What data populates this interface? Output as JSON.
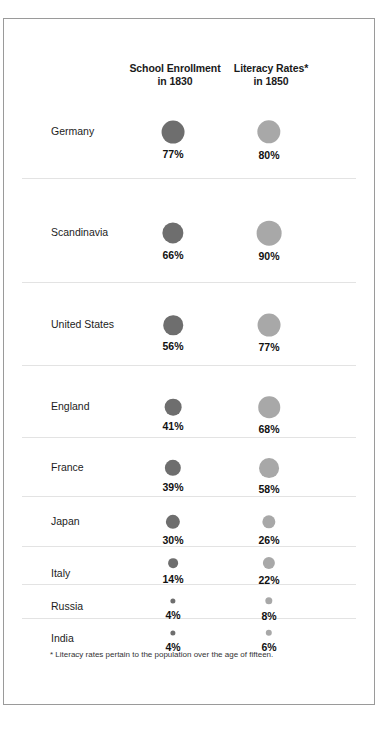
{
  "header": {
    "col1_line1": "School Enrollment",
    "col1_line2": "in 1830",
    "col2_line1": "Literacy Rates*",
    "col2_line2": "in 1850"
  },
  "footnote": "* Literacy rates pertain to the population over the age of fifteen.",
  "colors": {
    "enrollment_bubble": "#6e6e6e",
    "literacy_bubble": "#a8a8a8",
    "divider": "#e3e3e3",
    "frame": "#9a9a9a",
    "text": "#1a1a1a",
    "background": "#ffffff"
  },
  "rows": [
    {
      "label": "Germany",
      "enrollment": "77%",
      "literacy": "80%"
    },
    {
      "label": "Scandinavia",
      "enrollment": "66%",
      "literacy": "90%"
    },
    {
      "label": "United States",
      "enrollment": "56%",
      "literacy": "77%"
    },
    {
      "label": "England",
      "enrollment": "41%",
      "literacy": "68%"
    },
    {
      "label": "France",
      "enrollment": "39%",
      "literacy": "58%"
    },
    {
      "label": "Japan",
      "enrollment": "30%",
      "literacy": "26%"
    },
    {
      "label": "Italy",
      "enrollment": "14%",
      "literacy": "22%"
    },
    {
      "label": "Russia",
      "enrollment": "4%",
      "literacy": "8%"
    },
    {
      "label": "India",
      "enrollment": "4%",
      "literacy": "6%"
    }
  ],
  "chart_data": {
    "type": "bubble",
    "title": "",
    "categories": [
      "Germany",
      "Scandinavia",
      "United States",
      "England",
      "France",
      "Japan",
      "Italy",
      "Russia",
      "India"
    ],
    "series": [
      {
        "name": "School Enrollment in 1830",
        "unit": "percent",
        "color": "#6e6e6e",
        "values": [
          77,
          66,
          56,
          41,
          39,
          30,
          14,
          4,
          4
        ]
      },
      {
        "name": "Literacy Rates* in 1850",
        "unit": "percent",
        "color": "#a8a8a8",
        "values": [
          80,
          90,
          77,
          68,
          58,
          26,
          22,
          8,
          6
        ]
      }
    ],
    "encoding": "bubble area proportional to percentage value",
    "xlabel": "",
    "ylabel": "",
    "grid": false,
    "legend": "column headers",
    "annotations": [
      "* Literacy rates pertain to the population over the age of fifteen."
    ]
  }
}
